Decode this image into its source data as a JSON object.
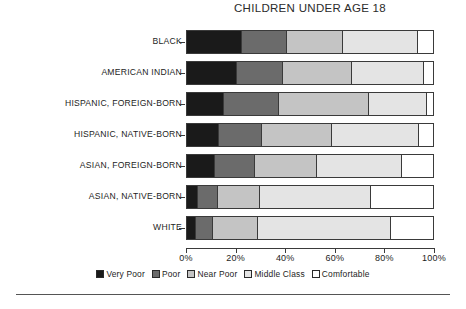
{
  "chart_data": {
    "type": "bar",
    "orientation": "horizontal",
    "stacked": true,
    "normalized_percent": true,
    "title": "CHILDREN UNDER AGE 18",
    "xlabel": "",
    "ylabel": "",
    "xlim": [
      0,
      100
    ],
    "grid": false,
    "legend_position": "bottom",
    "xtick_labels": [
      "0%",
      "20%",
      "40%",
      "60%",
      "80%",
      "100%"
    ],
    "xtick_values": [
      0,
      20,
      40,
      60,
      80,
      100
    ],
    "categories": [
      "BLACK",
      "AMERICAN INDIAN",
      "HISPANIC, FOREIGN-BORN",
      "HISPANIC, NATIVE-BORN",
      "ASIAN, FOREIGN-BORN",
      "ASIAN, NATIVE-BORN",
      "WHITE"
    ],
    "series": [
      {
        "name": "Very Poor",
        "color": "#1a1a1a",
        "values": [
          22.5,
          20.5,
          15.0,
          13.0,
          11.5,
          4.5,
          3.5
        ]
      },
      {
        "name": "Poor",
        "color": "#6b6b6b",
        "values": [
          18.0,
          18.5,
          22.5,
          17.5,
          16.0,
          8.0,
          7.0
        ]
      },
      {
        "name": "Near Poor",
        "color": "#c4c4c4",
        "values": [
          23.0,
          28.0,
          36.5,
          28.5,
          25.5,
          17.0,
          18.5
        ]
      },
      {
        "name": "Middle Class",
        "color": "#e4e4e4",
        "values": [
          30.5,
          29.5,
          23.5,
          35.5,
          34.5,
          45.5,
          54.0
        ]
      },
      {
        "name": "Comfortable",
        "color": "#ffffff",
        "values": [
          6.0,
          3.5,
          2.5,
          5.5,
          12.5,
          25.0,
          17.0
        ]
      }
    ]
  },
  "legend": {
    "items": [
      {
        "label": "Very Poor",
        "color": "#1a1a1a"
      },
      {
        "label": "Poor",
        "color": "#6b6b6b"
      },
      {
        "label": "Near Poor",
        "color": "#c4c4c4"
      },
      {
        "label": "Middle Class",
        "color": "#e4e4e4"
      },
      {
        "label": "Comfortable",
        "color": "#ffffff"
      }
    ]
  }
}
